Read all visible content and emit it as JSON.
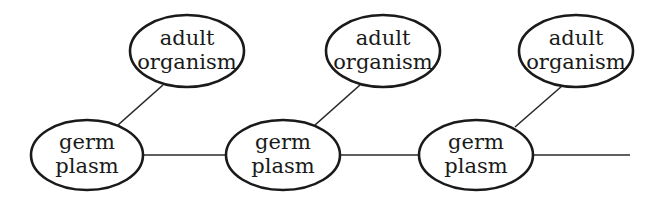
{
  "diagram": {
    "title": "",
    "nodes": [
      {
        "id": "germ1",
        "type": "germ",
        "line1": "germ",
        "line2": "plasm",
        "cx": 87,
        "cy": 155
      },
      {
        "id": "germ2",
        "type": "germ",
        "line1": "germ",
        "line2": "plasm",
        "cx": 283,
        "cy": 155
      },
      {
        "id": "germ3",
        "type": "germ",
        "line1": "germ",
        "line2": "plasm",
        "cx": 476,
        "cy": 155
      },
      {
        "id": "adult1",
        "type": "adult",
        "line1": "adult",
        "line2": "organism",
        "cx": 187,
        "cy": 51
      },
      {
        "id": "adult2",
        "type": "adult",
        "line1": "adult",
        "line2": "organism",
        "cx": 383,
        "cy": 51
      },
      {
        "id": "adult3",
        "type": "adult",
        "line1": "adult",
        "line2": "organism",
        "cx": 576,
        "cy": 51
      }
    ],
    "edges": [
      {
        "from": "germ1",
        "to": "germ2"
      },
      {
        "from": "germ2",
        "to": "germ3"
      },
      {
        "from": "germ3",
        "to": "continuation"
      },
      {
        "from": "germ1",
        "to": "adult1"
      },
      {
        "from": "germ2",
        "to": "adult2"
      },
      {
        "from": "germ3",
        "to": "adult3"
      }
    ],
    "colors": {
      "stroke": "#1a1a1a",
      "background": "#ffffff"
    }
  }
}
